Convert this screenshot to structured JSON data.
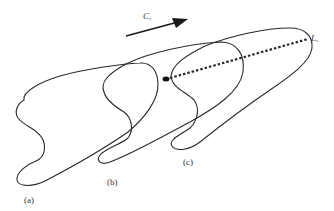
{
  "figure": {
    "type": "schematic",
    "colors": {
      "stroke": "#2a2a2a",
      "background": "#ffffff"
    }
  },
  "labels": {
    "shape_a": "(a)",
    "shape_b": "(b)",
    "shape_c": "(c)",
    "velocity_symbol": "C",
    "velocity_subscript": "s",
    "length_symbol": "L",
    "length_subscript": "s"
  },
  "elements": {
    "arrow": {
      "direction": "upper-right",
      "label": "Cs"
    },
    "dashed_line": {
      "from": [
        168,
        78
      ],
      "to": [
        308,
        39
      ],
      "label": "Ls"
    },
    "dot": {
      "position": [
        167,
        79
      ]
    }
  }
}
